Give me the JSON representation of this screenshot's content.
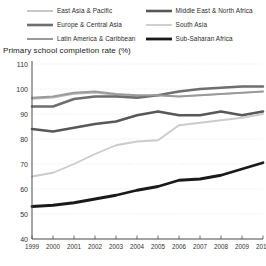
{
  "axis_title": "Primary school completion rate (%)",
  "legend": {
    "position": "top",
    "items": [
      {
        "label": "East Asia & Pacific",
        "color": "#b9b9b9",
        "width": 1.6,
        "icon": "line-swatch-icon"
      },
      {
        "label": "Middle East & North Africa",
        "color": "#585858",
        "width": 2.6,
        "icon": "line-swatch-icon"
      },
      {
        "label": "Europe & Central Asia",
        "color": "#6e6e6e",
        "width": 2.6,
        "icon": "line-swatch-icon"
      },
      {
        "label": "South Asia",
        "color": "#cbcbcb",
        "width": 1.8,
        "icon": "line-swatch-icon"
      },
      {
        "label": "Latin America & Caribbean",
        "color": "#9a9a9a",
        "width": 2.0,
        "icon": "line-swatch-icon"
      },
      {
        "label": "Sub-Saharan Africa",
        "color": "#1a1a1a",
        "width": 2.8,
        "icon": "line-swatch-icon"
      }
    ]
  },
  "chart_data": {
    "type": "line",
    "title": "Primary school completion rate (%)",
    "xlabel": "",
    "ylabel": "Primary school completion rate (%)",
    "x": [
      1999,
      2000,
      2001,
      2002,
      2003,
      2004,
      2005,
      2006,
      2007,
      2008,
      2009,
      2010
    ],
    "xlim": [
      1999,
      2010
    ],
    "ylim": [
      40,
      110
    ],
    "yticks": [
      40,
      50,
      60,
      70,
      80,
      90,
      100,
      110
    ],
    "xticks": [
      "1999",
      "2000",
      "2001",
      "2002",
      "2003",
      "2004",
      "2005",
      "2006",
      "2007",
      "2008",
      "2009",
      "2010"
    ],
    "grid": "horizontal-dotted",
    "series": [
      {
        "name": "East Asia & Pacific",
        "color": "#b9b9b9",
        "stroke_width": 1.6,
        "values": [
          96.0,
          96.5,
          98.0,
          98.5,
          97.5,
          97.0,
          97.5,
          97.0,
          97.5,
          98.0,
          98.5,
          99.0
        ]
      },
      {
        "name": "Europe & Central Asia",
        "color": "#6e6e6e",
        "stroke_width": 2.6,
        "values": [
          93.0,
          93.0,
          96.0,
          97.0,
          97.0,
          96.5,
          97.5,
          99.0,
          100.0,
          100.5,
          101.0,
          101.0
        ]
      },
      {
        "name": "Latin America & Caribbean",
        "color": "#9a9a9a",
        "stroke_width": 2.0,
        "values": [
          96.5,
          97.0,
          98.5,
          99.0,
          98.0,
          97.5,
          97.5,
          97.0,
          97.5,
          98.0,
          98.5,
          99.0
        ]
      },
      {
        "name": "Middle East & North Africa",
        "color": "#585858",
        "stroke_width": 2.6,
        "values": [
          84.0,
          83.0,
          84.5,
          86.0,
          87.0,
          89.5,
          91.0,
          89.5,
          89.5,
          91.0,
          89.5,
          91.0
        ]
      },
      {
        "name": "South Asia",
        "color": "#cbcbcb",
        "stroke_width": 1.8,
        "values": [
          65.0,
          66.5,
          70.0,
          74.0,
          77.5,
          79.0,
          79.5,
          85.5,
          86.5,
          87.5,
          88.5,
          90.0
        ]
      },
      {
        "name": "Sub-Saharan Africa",
        "color": "#1a1a1a",
        "stroke_width": 2.8,
        "values": [
          53.0,
          53.5,
          54.5,
          56.0,
          57.5,
          59.5,
          61.0,
          63.5,
          64.0,
          65.5,
          68.0,
          70.5
        ]
      }
    ]
  }
}
